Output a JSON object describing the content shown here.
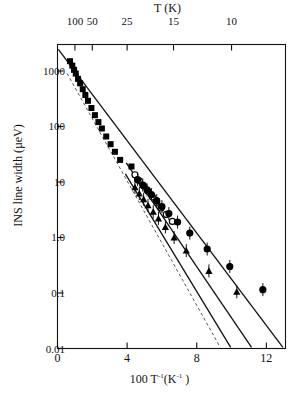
{
  "figure": {
    "background": "#ffffff",
    "ink": "#000000"
  },
  "chart_data": {
    "type": "scatter",
    "title": "",
    "xlabel": "100 T-1(K-1)",
    "ylabel": "INS line width (µeV)",
    "top_axis_label": "T (K)",
    "xlim": [
      0,
      13.1
    ],
    "ylim_log": [
      0.01,
      3000
    ],
    "yscale": "log",
    "grid": false,
    "legend": "none",
    "xticks": [
      0,
      4,
      8,
      12
    ],
    "xtick_labels": [
      "0",
      "4",
      "8",
      "12"
    ],
    "yticks": [
      1000,
      100,
      10,
      1.0,
      0.1,
      0.01
    ],
    "ytick_labels": [
      "1000",
      "100",
      "10",
      "1.0",
      "0.1",
      "0.01"
    ],
    "top_ticks_T": [
      100,
      50,
      25,
      15,
      10
    ],
    "top_tick_labels": [
      "100",
      "50",
      "25",
      "15",
      "10"
    ],
    "series": [
      {
        "name": "filled-squares",
        "marker": "square",
        "fill": "solid",
        "points": [
          {
            "x": 0.72,
            "y": 1500
          },
          {
            "x": 0.85,
            "y": 1250
          },
          {
            "x": 0.95,
            "y": 1050
          },
          {
            "x": 1.05,
            "y": 900
          },
          {
            "x": 1.18,
            "y": 720
          },
          {
            "x": 1.3,
            "y": 600
          },
          {
            "x": 1.45,
            "y": 470
          },
          {
            "x": 1.6,
            "y": 370
          },
          {
            "x": 1.75,
            "y": 290
          },
          {
            "x": 1.95,
            "y": 215
          },
          {
            "x": 2.15,
            "y": 160
          },
          {
            "x": 2.35,
            "y": 120
          },
          {
            "x": 2.55,
            "y": 92
          },
          {
            "x": 2.8,
            "y": 66
          },
          {
            "x": 3.05,
            "y": 48
          },
          {
            "x": 3.3,
            "y": 35
          },
          {
            "x": 3.6,
            "y": 25
          },
          {
            "x": 4.25,
            "y": 19
          }
        ]
      },
      {
        "name": "open-circles",
        "marker": "circle",
        "fill": "open",
        "points": [
          {
            "x": 4.45,
            "y": 13.5
          },
          {
            "x": 4.7,
            "y": 10.5
          },
          {
            "x": 4.95,
            "y": 8.5
          },
          {
            "x": 5.2,
            "y": 6.8
          },
          {
            "x": 5.45,
            "y": 5.4
          },
          {
            "x": 5.7,
            "y": 4.3
          },
          {
            "x": 5.95,
            "y": 3.4
          },
          {
            "x": 6.25,
            "y": 2.6
          },
          {
            "x": 6.6,
            "y": 1.95
          }
        ]
      },
      {
        "name": "filled-circles",
        "marker": "circle",
        "fill": "solid",
        "errorbars": true,
        "points": [
          {
            "x": 4.6,
            "y": 11.0
          },
          {
            "x": 4.9,
            "y": 8.8
          },
          {
            "x": 5.15,
            "y": 7.2
          },
          {
            "x": 5.4,
            "y": 5.9
          },
          {
            "x": 5.7,
            "y": 4.6
          },
          {
            "x": 6.0,
            "y": 3.6
          },
          {
            "x": 6.4,
            "y": 2.7
          },
          {
            "x": 6.9,
            "y": 1.9
          },
          {
            "x": 7.6,
            "y": 1.2
          },
          {
            "x": 8.6,
            "y": 0.62
          },
          {
            "x": 9.9,
            "y": 0.3
          },
          {
            "x": 11.8,
            "y": 0.115
          }
        ]
      },
      {
        "name": "filled-triangles",
        "marker": "triangle",
        "fill": "solid",
        "errorbars": true,
        "points": [
          {
            "x": 4.45,
            "y": 8.0
          },
          {
            "x": 4.7,
            "y": 6.2
          },
          {
            "x": 4.95,
            "y": 4.9
          },
          {
            "x": 5.2,
            "y": 3.8
          },
          {
            "x": 5.5,
            "y": 2.9
          },
          {
            "x": 5.8,
            "y": 2.2
          },
          {
            "x": 6.2,
            "y": 1.55
          },
          {
            "x": 6.7,
            "y": 1.0
          },
          {
            "x": 7.4,
            "y": 0.58
          },
          {
            "x": 8.7,
            "y": 0.25
          },
          {
            "x": 10.3,
            "y": 0.105
          }
        ]
      }
    ],
    "fit_lines": [
      {
        "name": "fit-line-upper",
        "style": "solid",
        "x0": 0.05,
        "y0": 2450,
        "x1": 12.95,
        "y1": 0.0105
      },
      {
        "name": "fit-line-middle",
        "style": "solid",
        "x0": 3.95,
        "y0": 22.0,
        "x1": 11.15,
        "y1": 0.0105
      },
      {
        "name": "fit-line-lower",
        "style": "solid",
        "x0": 3.9,
        "y0": 14.0,
        "x1": 9.95,
        "y1": 0.0105
      },
      {
        "name": "model-curve-dashed",
        "style": "dashed",
        "x0": 0.55,
        "y0": 900,
        "x1": 9.35,
        "y1": 0.0105
      }
    ]
  }
}
